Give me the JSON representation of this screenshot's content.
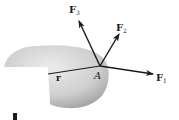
{
  "diagram": {
    "point": {
      "label": "A",
      "x": 100,
      "y": 66
    },
    "position_vector": {
      "label": "r",
      "from": [
        48,
        74
      ],
      "to": [
        100,
        66
      ]
    },
    "forces": [
      {
        "name": "F",
        "sub": "1",
        "tip": [
          153,
          74
        ]
      },
      {
        "name": "F",
        "sub": "2",
        "tip": [
          119,
          34
        ]
      },
      {
        "name": "F",
        "sub": "3",
        "tip": [
          79,
          21
        ]
      }
    ],
    "colors": {
      "body_light": "#e6e6e6",
      "body_dark": "#9a9a9a",
      "line": "#1a1a1a"
    }
  }
}
